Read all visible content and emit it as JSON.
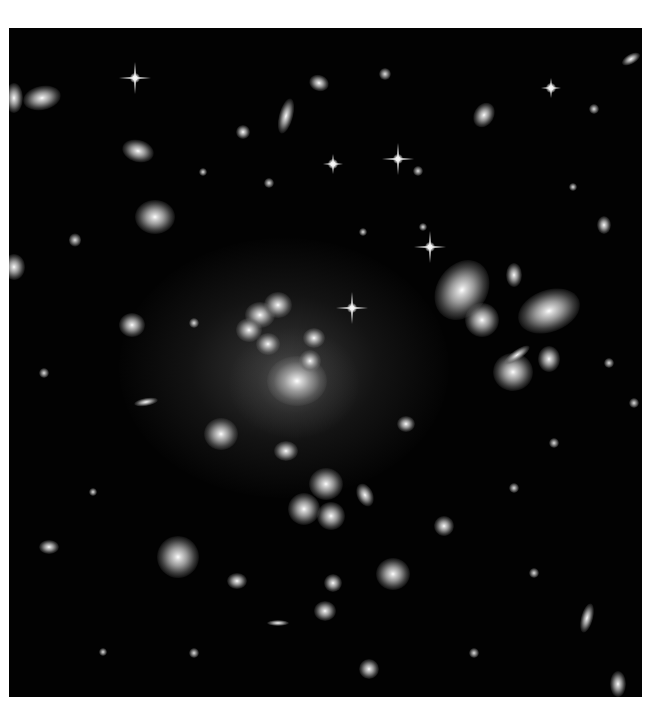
{
  "image": {
    "subject": "galaxy-cluster-deep-field",
    "background_color": "#020202",
    "page_background": "#ffffff"
  }
}
